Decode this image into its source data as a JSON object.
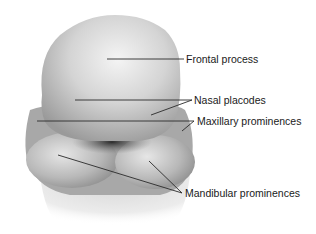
{
  "figure": {
    "labels": [
      {
        "text": "Frontal process",
        "x": 186,
        "y": 53
      },
      {
        "text": "Nasal placodes",
        "x": 194,
        "y": 94
      },
      {
        "text": "Maxillary prominences",
        "x": 197,
        "y": 115
      },
      {
        "text": "Mandibular prominences",
        "x": 185,
        "y": 187
      }
    ],
    "colors": {
      "line": "#2a2a2a",
      "text": "#1a1a1a",
      "background": "#ffffff"
    }
  }
}
